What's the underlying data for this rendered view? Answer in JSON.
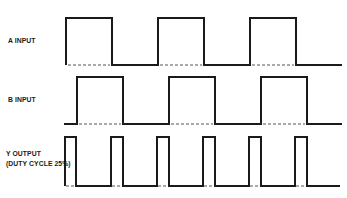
{
  "diagram": {
    "type": "timing-diagram",
    "signals": [
      {
        "name": "A INPUT",
        "label_lines": [
          "A INPUT"
        ],
        "label_pos": [
          8,
          36
        ],
        "high_y": 18,
        "low_y": 65,
        "start_level": "high",
        "edges_x": [
          66,
          112,
          158,
          204,
          250,
          296
        ],
        "start_x": 66,
        "end_x": 342,
        "dashed_baseline_segments": [
          [
            68,
            110
          ],
          [
            160,
            202
          ],
          [
            252,
            294
          ]
        ]
      },
      {
        "name": "B INPUT",
        "label_lines": [
          "B INPUT"
        ],
        "label_pos": [
          8,
          95
        ],
        "high_y": 77,
        "low_y": 124,
        "start_level": "low",
        "edges_x": [
          77,
          123,
          169,
          215,
          261,
          307
        ],
        "start_x": 64,
        "end_x": 342,
        "dashed_baseline_segments": [
          [
            79,
            121
          ],
          [
            171,
            213
          ],
          [
            263,
            305
          ]
        ]
      },
      {
        "name": "Y OUTPUT",
        "label_lines": [
          "Y OUTPUT",
          "(DUTY CYCLE 25%)"
        ],
        "label_pos": [
          6,
          152
        ],
        "high_y": 137,
        "low_y": 186,
        "start_level": "high",
        "edges_x": [
          65,
          76,
          111,
          123,
          157,
          169,
          203,
          215,
          249,
          261,
          295,
          307
        ],
        "start_x": 65,
        "end_x": 340,
        "dashed_baseline_segments": [
          [
            66,
            75
          ],
          [
            112,
            122
          ],
          [
            158,
            168
          ],
          [
            204,
            214
          ],
          [
            250,
            260
          ],
          [
            296,
            306
          ]
        ]
      }
    ],
    "line_color": "#1a1a1a",
    "dash_color": "#555555"
  }
}
